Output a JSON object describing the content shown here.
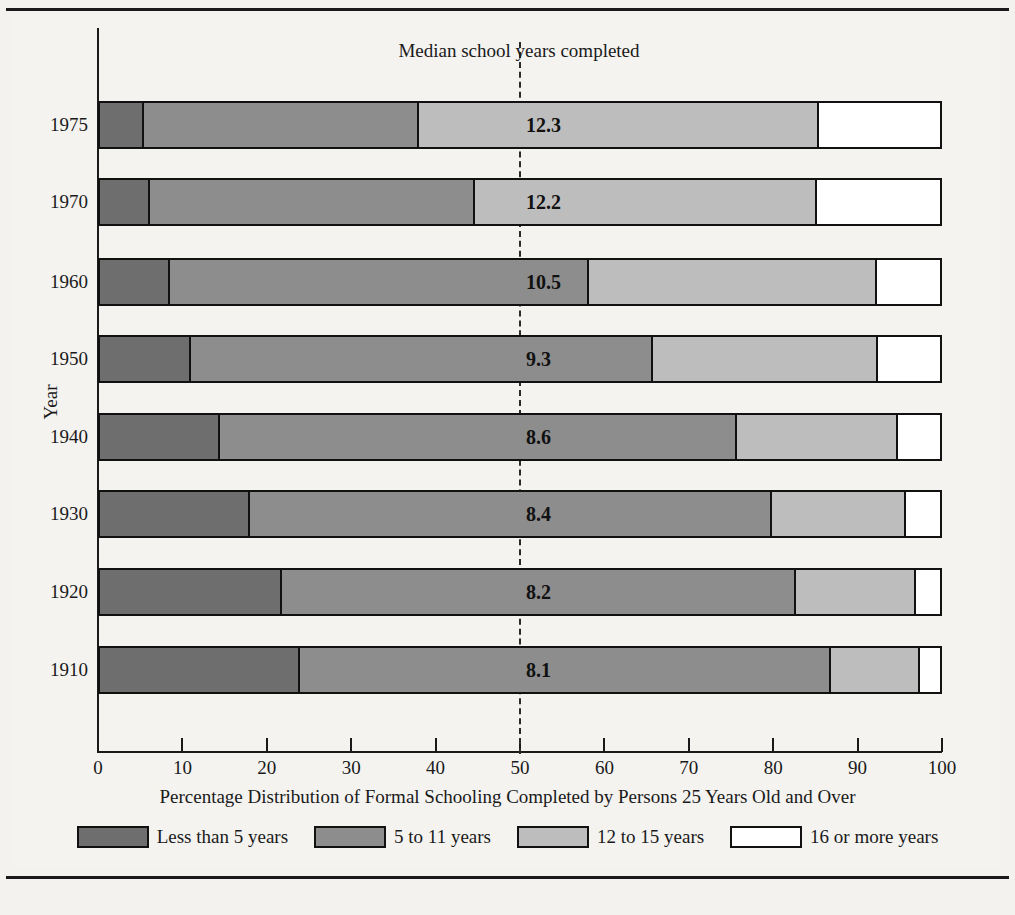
{
  "chart_data": {
    "type": "bar",
    "orientation": "horizontal",
    "stacked": true,
    "title": "",
    "xlabel": "Percentage Distribution of Formal Schooling Completed by Persons 25 Years Old  and Over",
    "ylabel": "Year",
    "xlim": [
      0,
      100
    ],
    "xticks": [
      0,
      10,
      20,
      30,
      40,
      50,
      60,
      70,
      80,
      90,
      100
    ],
    "xtick_labels": [
      "0",
      "10",
      "20",
      "30",
      "40",
      "50",
      "60",
      "70",
      "80",
      "90",
      "100"
    ],
    "grid": false,
    "legend_position": "bottom",
    "categories": [
      "1975",
      "1970",
      "1960",
      "1950",
      "1940",
      "1930",
      "1920",
      "1910"
    ],
    "series": [
      {
        "name": "Less than 5 years",
        "color": "#6e6e6e",
        "values": [
          5.2,
          5.9,
          8.3,
          10.8,
          14.3,
          17.8,
          21.7,
          23.8
        ]
      },
      {
        "name": "5 to 11 years",
        "color": "#8d8d8d",
        "values": [
          32.8,
          38.8,
          49.9,
          55.0,
          61.5,
          62.2,
          61.1,
          63.2
        ]
      },
      {
        "name": "12 to 15 years",
        "color": "#bdbdbd",
        "values": [
          47.6,
          40.6,
          34.3,
          26.8,
          19.2,
          15.9,
          14.4,
          10.6
        ]
      },
      {
        "name": "16 or more years",
        "color": "#ffffff",
        "values": [
          14.4,
          14.7,
          7.5,
          7.4,
          5.0,
          4.1,
          2.8,
          2.4
        ]
      }
    ],
    "annotations": {
      "median_caption": "Median school years completed",
      "median_reference_x": 50,
      "median_values": [
        "12.3",
        "12.2",
        "10.5",
        "9.3",
        "8.6",
        "8.4",
        "8.2",
        "8.1"
      ]
    }
  },
  "legend": {
    "items": [
      {
        "label": "Less than 5 years",
        "color": "#6e6e6e"
      },
      {
        "label": "5 to 11 years",
        "color": "#8d8d8d"
      },
      {
        "label": "12 to 15 years",
        "color": "#bdbdbd"
      },
      {
        "label": "16 or more years",
        "color": "#ffffff"
      }
    ]
  },
  "colors": {
    "page_background": "#f3f2ef",
    "plot_background": "#f4f3f0",
    "ink": "#1a1a1a",
    "segment_1": "#6e6e6e",
    "segment_2": "#8d8d8d",
    "segment_3": "#bdbdbd",
    "segment_4": "#ffffff"
  }
}
